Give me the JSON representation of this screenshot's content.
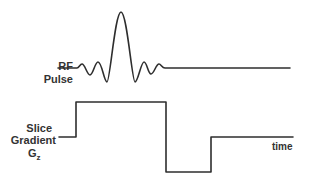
{
  "diagram": {
    "title": "",
    "rf": {
      "label_line1": "RF",
      "label_line2": "Pulse",
      "shape": "sinc"
    },
    "gradient": {
      "label_line1": "Slice",
      "label_line2": "Gradient",
      "label_symbol": "G",
      "label_subscript": "z",
      "shape": "positive lobe followed by negative refocusing lobe"
    },
    "axis": {
      "time_label": "time"
    },
    "colors": {
      "stroke": "#2e2e2e",
      "text": "#333333",
      "background": "#ffffff"
    }
  }
}
